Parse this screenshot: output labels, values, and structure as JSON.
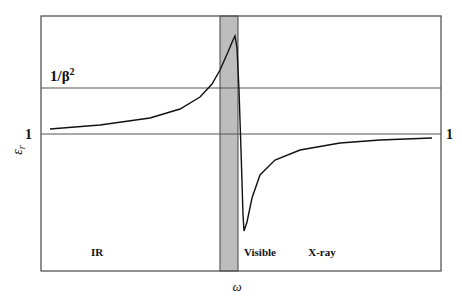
{
  "chart_data": {
    "type": "line",
    "title": "",
    "xlabel": "ω",
    "ylabel": "ε_r",
    "x_tick_labels": [],
    "y_reference_lines": [
      {
        "label": "1/β²",
        "value_label": "1/β^2"
      },
      {
        "label": "1",
        "value_label": "1"
      }
    ],
    "shaded_band": {
      "label": "absorption/resonance region",
      "color": "#bdbdbd"
    },
    "region_labels": [
      "IR",
      "Visible",
      "X-ray"
    ],
    "series": [
      {
        "name": "ε_r(ω)",
        "description": "Dielectric constant vs frequency with anomalous dispersion near resonance: slowly rises from just above 1 in IR, sharp peak above 1/β² inside shaded band, plunges below 1 just after band, then recovers asymptotically toward 1 in X-ray region",
        "points_px": [
          [
            50,
            129
          ],
          [
            100,
            125
          ],
          [
            150,
            118
          ],
          [
            180,
            109
          ],
          [
            200,
            97
          ],
          [
            212,
            84
          ],
          [
            220,
            70
          ],
          [
            228,
            52
          ],
          [
            233,
            40
          ],
          [
            235,
            36
          ],
          [
            237,
            48
          ],
          [
            239,
            90
          ],
          [
            241,
            150
          ],
          [
            243,
            215
          ],
          [
            244,
            231
          ],
          [
            247,
            222
          ],
          [
            252,
            198
          ],
          [
            260,
            175
          ],
          [
            275,
            160
          ],
          [
            300,
            150
          ],
          [
            340,
            143
          ],
          [
            380,
            140
          ],
          [
            432,
            138
          ]
        ]
      }
    ],
    "grid": false,
    "legend": null
  },
  "labels": {
    "y_label": "ε",
    "y_label_sub": "r",
    "x_label": "ω",
    "line_1_over_beta_sq": "1/β",
    "line_1_over_beta_sq_sup": "2",
    "line_one_left": "1",
    "line_one_right": "1",
    "region_ir": "IR",
    "region_visible": "Visible",
    "region_xray": "X-ray",
    "stray_mark": "β"
  }
}
